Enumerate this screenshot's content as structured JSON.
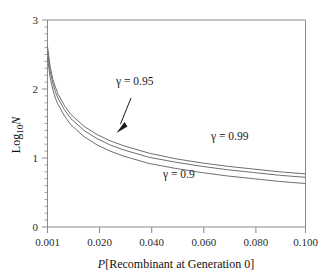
{
  "chart_data": {
    "type": "line",
    "title": "",
    "subtitle": "",
    "xlabel": "P[Recombinant at Generation 0]",
    "ylabel": "Log10 N",
    "ylabel_base": "Log",
    "ylabel_sub": "10",
    "ylabel_var": "N",
    "xlim": [
      0.001,
      0.1
    ],
    "ylim": [
      0,
      3
    ],
    "grid": false,
    "legend": "inline-annotations",
    "x_ticks": [
      0.001,
      0.02,
      0.04,
      0.06,
      0.08,
      0.1
    ],
    "x_tick_labels": [
      "0.001",
      "0.020",
      "0.040",
      "0.060",
      "0.080",
      "0.100"
    ],
    "y_ticks": [
      0,
      1,
      2,
      3
    ],
    "y_tick_labels": [
      "0",
      "1",
      "2",
      "3"
    ],
    "y_minor_step": 0.1,
    "x": [
      0.001,
      0.002,
      0.003,
      0.004,
      0.005,
      0.0075,
      0.01,
      0.015,
      0.02,
      0.025,
      0.03,
      0.04,
      0.05,
      0.06,
      0.07,
      0.08,
      0.09,
      0.1
    ],
    "series": [
      {
        "name": "gamma = 0.99",
        "label": "γ = 0.99",
        "gamma": 0.99,
        "color": "#6f6f6f",
        "values": [
          2.62,
          2.33,
          2.15,
          2.03,
          1.93,
          1.76,
          1.63,
          1.46,
          1.34,
          1.25,
          1.18,
          1.07,
          0.99,
          0.93,
          0.88,
          0.84,
          0.8,
          0.77
        ]
      },
      {
        "name": "gamma = 0.95",
        "label": "γ = 0.95",
        "gamma": 0.95,
        "color": "#6f6f6f",
        "values": [
          2.55,
          2.26,
          2.09,
          1.96,
          1.87,
          1.7,
          1.57,
          1.4,
          1.28,
          1.19,
          1.12,
          1.01,
          0.94,
          0.88,
          0.83,
          0.79,
          0.75,
          0.72
        ]
      },
      {
        "name": "gamma = 0.9",
        "label": "γ = 0.9",
        "gamma": 0.9,
        "color": "#6f6f6f",
        "values": [
          2.46,
          2.17,
          2.0,
          1.87,
          1.78,
          1.61,
          1.48,
          1.31,
          1.19,
          1.1,
          1.03,
          0.92,
          0.85,
          0.79,
          0.74,
          0.7,
          0.66,
          0.63
        ]
      }
    ],
    "annotations": [
      {
        "name": "gamma-095-annotation",
        "text": "γ = 0.95",
        "x_px": 116,
        "y_px": 85,
        "leader": true
      },
      {
        "name": "gamma-099-annotation",
        "text": "γ = 0.99",
        "x_px": 211,
        "y_px": 140,
        "leader": false
      },
      {
        "name": "gamma-09-annotation",
        "text": "γ = 0.9",
        "x_px": 163,
        "y_px": 178,
        "leader": false
      }
    ]
  }
}
